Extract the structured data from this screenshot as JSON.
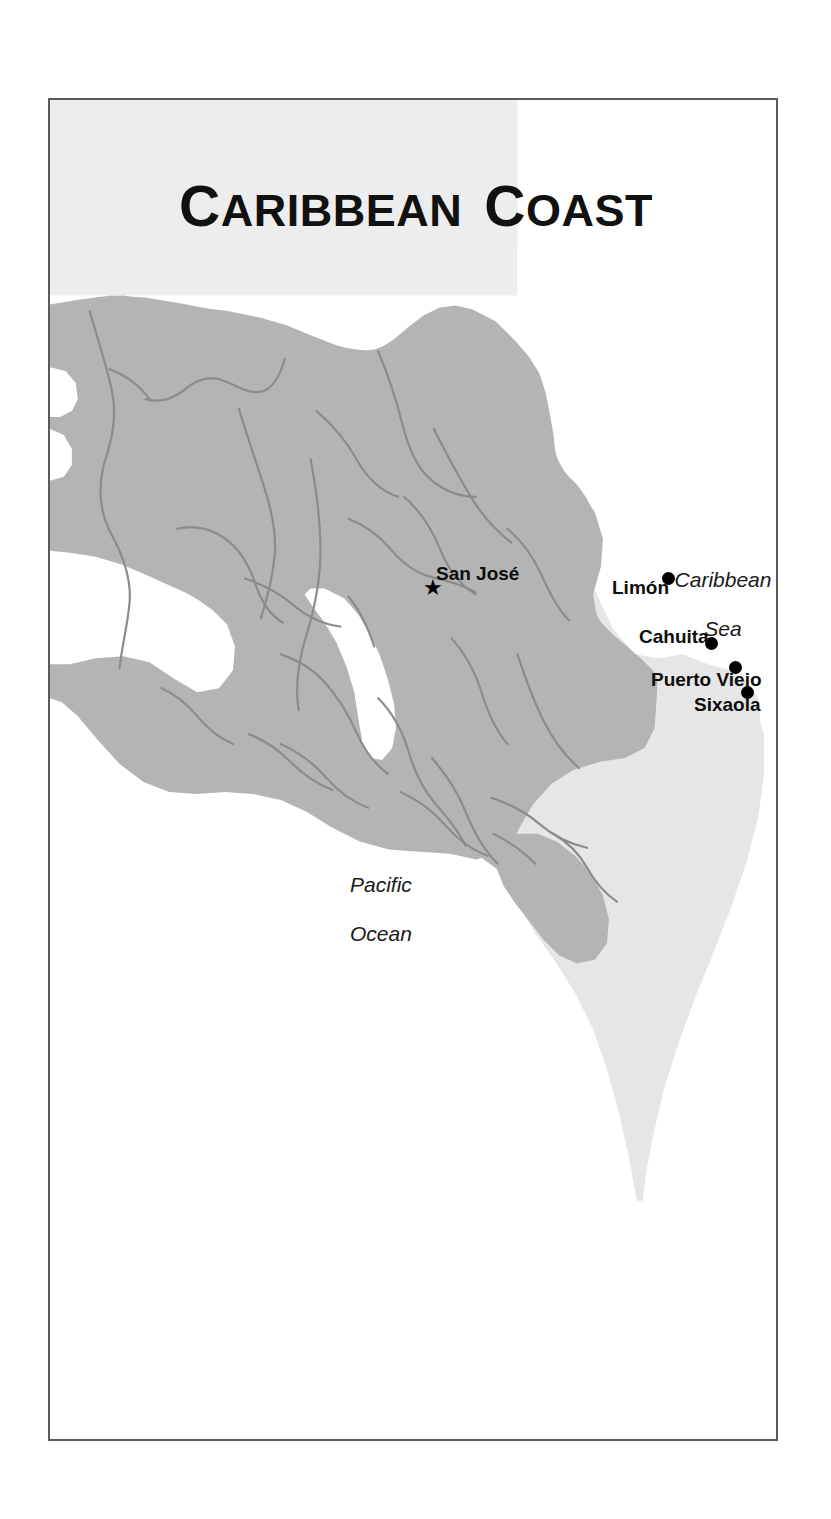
{
  "figure": {
    "kind": "reference-map",
    "title_primary": "Caribbean",
    "title_secondary": "Coast",
    "title_full": "CARIBBEAN COAST",
    "region": "Costa Rica"
  },
  "title": {
    "word1_cap": "C",
    "word1_rest": "ARIBBEAN",
    "word2_cap": "C",
    "word2_rest": "OAST"
  },
  "water_bodies": [
    {
      "id": "caribbean-sea",
      "name": "Caribbean\nSea",
      "line1": "Caribbean",
      "line2": "Sea"
    },
    {
      "id": "pacific-ocean",
      "name": "Pacific\nOcean",
      "line1": "Pacific",
      "line2": "Ocean"
    }
  ],
  "cities": [
    {
      "id": "san-jose",
      "label": "San José",
      "marker": "star",
      "label_align": "right-of-marker"
    },
    {
      "id": "limon",
      "label": "Limón",
      "marker": "dot",
      "label_align": "left-of-marker"
    },
    {
      "id": "cahuita",
      "label": "Cahuita",
      "marker": "dot",
      "label_align": "left-of-marker"
    },
    {
      "id": "puerto-viejo",
      "label": "Puerto Viejo",
      "marker": "dot",
      "label_align": "left-of-marker"
    },
    {
      "id": "sixaola",
      "label": "Sixaola",
      "marker": "dot",
      "label_align": "left-of-marker"
    }
  ],
  "colors": {
    "frame_border": "#5a5a5a",
    "land_primary": "#b4b4b4",
    "land_neighbor": "#e6e6e6",
    "water": "#ffffff",
    "river_line": "#8c8c8c",
    "boundary_line": "#8a8a8a",
    "text": "#0d0d0d",
    "title_backdrop": "#ededed"
  }
}
